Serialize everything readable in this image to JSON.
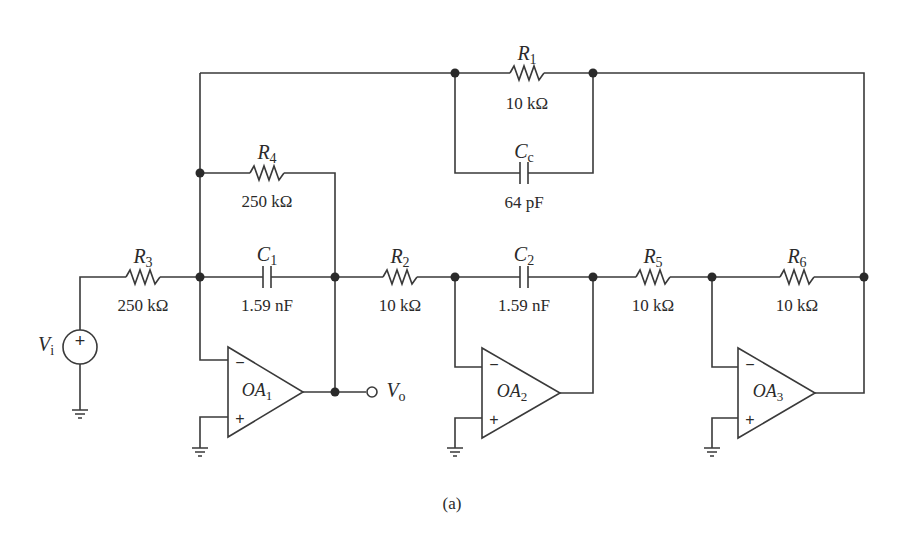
{
  "figure": {
    "caption": "(a)"
  },
  "components": {
    "R1": {
      "symbol": "R",
      "sub": "1",
      "value": "10 kΩ"
    },
    "Cc": {
      "symbol": "C",
      "sub": "c",
      "value": "64 pF"
    },
    "R4": {
      "symbol": "R",
      "sub": "4",
      "value": "250 kΩ"
    },
    "R3": {
      "symbol": "R",
      "sub": "3",
      "value": "250 kΩ"
    },
    "C1": {
      "symbol": "C",
      "sub": "1",
      "value": "1.59 nF"
    },
    "R2": {
      "symbol": "R",
      "sub": "2",
      "value": "10 kΩ"
    },
    "C2": {
      "symbol": "C",
      "sub": "2",
      "value": "1.59 nF"
    },
    "R5": {
      "symbol": "R",
      "sub": "5",
      "value": "10 kΩ"
    },
    "R6": {
      "symbol": "R",
      "sub": "6",
      "value": "10 kΩ"
    }
  },
  "opamps": {
    "OA1": {
      "symbol": "OA",
      "sub": "1",
      "minus": "−",
      "plus": "+"
    },
    "OA2": {
      "symbol": "OA",
      "sub": "2",
      "minus": "−",
      "plus": "+"
    },
    "OA3": {
      "symbol": "OA",
      "sub": "3",
      "minus": "−",
      "plus": "+"
    }
  },
  "source": {
    "symbol": "V",
    "sub": "i",
    "polarity": "+"
  },
  "output": {
    "symbol": "V",
    "sub": "o"
  }
}
